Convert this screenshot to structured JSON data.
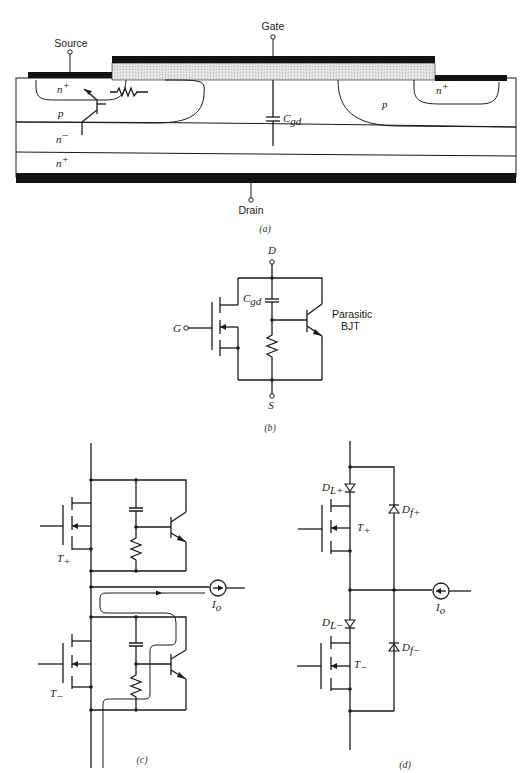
{
  "page": {
    "type": "textbook-figure"
  },
  "panel_a": {
    "caption": "(a)",
    "gate_label": "Gate",
    "source_label": "Source",
    "drain_label": "Drain",
    "capacitor_label": "C",
    "capacitor_sub": "gd",
    "regions": {
      "n_plus_left": "n",
      "n_plus_right": "n",
      "p_left": "p",
      "p_right": "p",
      "n_minus": "n",
      "n_plus_substrate": "n",
      "plus_sup": "+",
      "minus_sup": "−"
    },
    "colors": {
      "metal": "#111111",
      "oxide": "#d9d9d9",
      "outline": "#1a1a1a"
    }
  },
  "panel_b": {
    "caption": "(b)",
    "drain_label": "D",
    "source_label": "S",
    "gate_label": "G",
    "capacitor_label": "C",
    "capacitor_sub": "gd",
    "bjt_label_line1": "Parasitic",
    "bjt_label_line2": "BJT"
  },
  "panel_c": {
    "caption": "(c)",
    "upper_switch": "T",
    "upper_switch_sub": "+",
    "lower_switch": "T",
    "lower_switch_sub": "−",
    "current_source": "I",
    "current_source_sub": "o"
  },
  "panel_d": {
    "caption": "(d)",
    "upper_switch": "T",
    "upper_switch_sub": "+",
    "lower_switch": "T",
    "lower_switch_sub": "−",
    "diode_upper_series": "D",
    "diode_upper_series_sub": "L+",
    "diode_lower_series": "D",
    "diode_lower_series_sub": "L−",
    "diode_upper_free": "D",
    "diode_upper_free_sub": "f+",
    "diode_lower_free": "D",
    "diode_lower_free_sub": "f−",
    "current_source": "I",
    "current_source_sub": "o"
  }
}
